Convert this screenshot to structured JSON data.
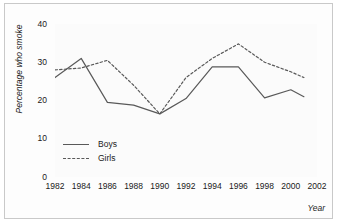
{
  "chart_data": {
    "type": "line",
    "title": "",
    "xlabel": "Year",
    "ylabel": "Percentage who smoke",
    "xlim": [
      1982,
      2002
    ],
    "ylim": [
      0,
      40
    ],
    "ytick_labels": [
      "0",
      "10",
      "20",
      "30",
      "40"
    ],
    "ytick_values": [
      0,
      10,
      20,
      30,
      40
    ],
    "xtick_labels": [
      "1982",
      "1984",
      "1986",
      "1988",
      "1990",
      "1992",
      "1994",
      "1996",
      "1998",
      "2000",
      "2002"
    ],
    "xtick_values": [
      1982,
      1984,
      1986,
      1988,
      1990,
      1992,
      1994,
      1996,
      1998,
      2000,
      2002
    ],
    "grid": false,
    "legend_position": "inside-lower-left",
    "x": [
      1982,
      1984,
      1986,
      1988,
      1990,
      1992,
      1994,
      1996,
      1998,
      2000,
      2001
    ],
    "series": [
      {
        "name": "Boys",
        "style": "solid",
        "color": "#595959",
        "values": [
          26,
          31,
          19.5,
          18.8,
          16.5,
          20.5,
          28.8,
          28.8,
          20.7,
          22.8,
          21
        ]
      },
      {
        "name": "Girls",
        "style": "dashed",
        "color": "#595959",
        "values": [
          28,
          28.5,
          30.5,
          24,
          16.5,
          26,
          31,
          34.8,
          30,
          27.5,
          26
        ]
      }
    ]
  },
  "legend": {
    "items": [
      {
        "label": "Boys"
      },
      {
        "label": "Girls"
      }
    ]
  },
  "colors": {
    "line": "#595959",
    "axis": "#4d4d4d",
    "text": "#1a1a1a",
    "plot_background": "#fbfbfb",
    "figure_background": "#fdfdfd",
    "frame_border": "#c9c9c9"
  }
}
